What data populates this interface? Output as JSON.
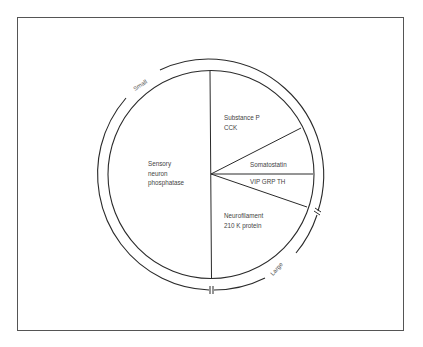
{
  "diagram": {
    "type": "pie-with-size-arcs",
    "segments": [
      {
        "id": "sensory",
        "lines": [
          "Sensory",
          "neuron",
          "phosphatase"
        ]
      },
      {
        "id": "substance-p",
        "lines": [
          "Substance P",
          "CCK"
        ]
      },
      {
        "id": "somatostatin",
        "lines": [
          "Somatostatin"
        ]
      },
      {
        "id": "vip",
        "lines": [
          "VIP GRP TH"
        ]
      },
      {
        "id": "neurofilament",
        "lines": [
          "Neurofilament",
          "210 K protein"
        ]
      }
    ],
    "arc_labels": {
      "small": "Small",
      "large": "Large"
    },
    "colors": {
      "line": "#2a2a2a",
      "text": "#444444",
      "frame": "#555555"
    }
  }
}
